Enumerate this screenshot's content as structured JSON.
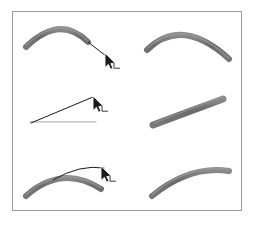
{
  "figure": {
    "background_color": "#ffffff",
    "frame": {
      "x": 12,
      "y": 11,
      "width": 230,
      "height": 200,
      "border_color": "#9a9a9a",
      "border_width": 1
    },
    "colors": {
      "thick_stroke": "#6a6a6a",
      "thick_stroke_shade": "#8c8c8c",
      "thin_guide": "#1a1a1a",
      "cursor_fill": "#1a1a1a",
      "cursor_outline": "#ffffff",
      "frame": "#9a9a9a",
      "background": "#ffffff"
    },
    "layout": {
      "rows": 3,
      "columns": 2,
      "column_labels": [
        "before-drag",
        "after-drag"
      ]
    }
  },
  "panels": [
    {
      "id": "row1-left",
      "name": "arch-being-dragged",
      "row": 1,
      "column": "left",
      "has_cursor": true,
      "thick_stroke": {
        "shape": "arch",
        "type": "quadratic",
        "start": [
          26,
          47
        ],
        "control": [
          60,
          14
        ],
        "end": [
          88,
          42
        ],
        "width": 6
      },
      "thin_guide": {
        "type": "line",
        "start": [
          88,
          42
        ],
        "end": [
          106,
          56
        ],
        "width": 1
      },
      "cursor": {
        "x": 105,
        "y": 53,
        "corner_mark": true
      }
    },
    {
      "id": "row1-right",
      "name": "arch-result",
      "row": 1,
      "column": "right",
      "has_cursor": false,
      "thick_stroke": {
        "shape": "arch",
        "type": "quadratic",
        "start": [
          147,
          50
        ],
        "control": [
          182,
          16
        ],
        "end": [
          229,
          59
        ],
        "width": 6
      }
    },
    {
      "id": "row2-left",
      "name": "horizontal-bar-being-dragged",
      "row": 2,
      "column": "left",
      "has_cursor": true,
      "thick_stroke": {
        "shape": "horizontal-bar",
        "type": "line",
        "start": [
          29,
          124
        ],
        "end": [
          97,
          124
        ],
        "width": 7
      },
      "thin_guide": {
        "type": "line",
        "start": [
          31,
          123
        ],
        "end": [
          93,
          97
        ],
        "width": 1
      },
      "cursor": {
        "x": 93,
        "y": 96,
        "corner_mark": true
      }
    },
    {
      "id": "row2-right",
      "name": "diagonal-bar-result",
      "row": 2,
      "column": "right",
      "has_cursor": false,
      "thick_stroke": {
        "shape": "diagonal-bar",
        "type": "line",
        "start": [
          153,
          125
        ],
        "end": [
          223,
          99
        ],
        "width": 7
      }
    },
    {
      "id": "row3-left",
      "name": "arc-being-dragged",
      "row": 3,
      "column": "left",
      "has_cursor": true,
      "thick_stroke": {
        "shape": "arc",
        "type": "quadratic",
        "start": [
          26,
          196
        ],
        "control": [
          62,
          164
        ],
        "end": [
          101,
          189
        ],
        "width": 6
      },
      "thin_guide": {
        "type": "quadratic",
        "start": [
          53,
          180
        ],
        "control": [
          80,
          164
        ],
        "end": [
          104,
          168
        ],
        "width": 1
      },
      "cursor": {
        "x": 101,
        "y": 166,
        "corner_mark": true
      }
    },
    {
      "id": "row3-right",
      "name": "arc-result",
      "row": 3,
      "column": "right",
      "has_cursor": false,
      "thick_stroke": {
        "shape": "arc",
        "type": "quadratic",
        "start": [
          152,
          196
        ],
        "control": [
          190,
          165
        ],
        "end": [
          229,
          171
        ],
        "width": 6
      }
    }
  ]
}
